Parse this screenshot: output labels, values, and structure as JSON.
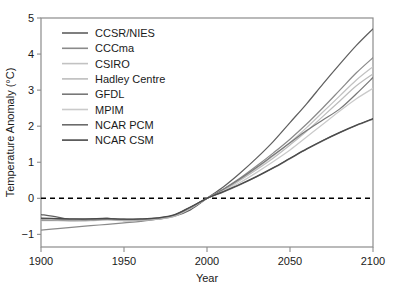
{
  "chart_data": {
    "type": "line",
    "title": "",
    "xlabel": "Year",
    "ylabel": "Temperature Anomaly (°C)",
    "xlim": [
      1900,
      2100
    ],
    "ylim": [
      -1.35,
      5.0
    ],
    "xticks": [
      1900,
      1950,
      2000,
      2050,
      2100
    ],
    "xtick_labels": [
      "1900",
      "1950",
      "2000",
      "2050",
      "2100"
    ],
    "yticks": [
      -1,
      0,
      1,
      2,
      3,
      4,
      5
    ],
    "ytick_labels": [
      "−1",
      "0",
      "1",
      "2",
      "3",
      "4",
      "5"
    ],
    "grid": false,
    "legend_position": "upper-left-inside",
    "reference_line": {
      "y": 0,
      "style": "dashed",
      "color": "#000000"
    },
    "x": [
      1900,
      1910,
      1920,
      1930,
      1940,
      1950,
      1960,
      1970,
      1980,
      1990,
      2000,
      2010,
      2020,
      2030,
      2040,
      2050,
      2060,
      2070,
      2080,
      2090,
      2100
    ],
    "series": [
      {
        "name": "CCSR/NIES",
        "color": "#5f5f5f",
        "end_value": 4.7,
        "values": [
          -0.45,
          -0.52,
          -0.6,
          -0.58,
          -0.55,
          -0.62,
          -0.6,
          -0.58,
          -0.5,
          -0.32,
          0.0,
          0.32,
          0.7,
          1.12,
          1.58,
          2.1,
          2.62,
          3.18,
          3.72,
          4.24,
          4.7
        ]
      },
      {
        "name": "CCCma",
        "color": "#8a8a8a",
        "end_value": 3.9,
        "values": [
          -0.88,
          -0.84,
          -0.8,
          -0.76,
          -0.72,
          -0.68,
          -0.64,
          -0.58,
          -0.48,
          -0.28,
          0.0,
          0.26,
          0.56,
          0.9,
          1.26,
          1.64,
          2.06,
          2.52,
          3.0,
          3.48,
          3.9
        ]
      },
      {
        "name": "CSIRO",
        "color": "#c2c2c2",
        "end_value": 3.65,
        "values": [
          -0.62,
          -0.62,
          -0.63,
          -0.62,
          -0.6,
          -0.62,
          -0.61,
          -0.58,
          -0.5,
          -0.28,
          0.0,
          0.24,
          0.52,
          0.84,
          1.18,
          1.55,
          1.96,
          2.4,
          2.84,
          3.28,
          3.65
        ]
      },
      {
        "name": "Hadley Centre",
        "color": "#bdbdbd",
        "end_value": 3.45,
        "values": [
          -0.6,
          -0.61,
          -0.62,
          -0.61,
          -0.59,
          -0.61,
          -0.6,
          -0.57,
          -0.49,
          -0.27,
          0.0,
          0.22,
          0.5,
          0.8,
          1.12,
          1.48,
          1.86,
          2.28,
          2.7,
          3.12,
          3.45
        ]
      },
      {
        "name": "GFDL",
        "color": "#787878",
        "end_value": 3.35,
        "values": [
          -0.6,
          -0.6,
          -0.61,
          -0.6,
          -0.58,
          -0.6,
          -0.59,
          -0.56,
          -0.48,
          -0.26,
          0.0,
          0.25,
          0.54,
          0.86,
          1.2,
          1.54,
          1.88,
          2.18,
          2.48,
          2.9,
          3.35
        ]
      },
      {
        "name": "MPIM",
        "color": "#cacaca",
        "end_value": 3.05,
        "values": [
          -0.58,
          -0.59,
          -0.6,
          -0.59,
          -0.58,
          -0.6,
          -0.59,
          -0.56,
          -0.48,
          -0.26,
          0.0,
          0.2,
          0.44,
          0.72,
          1.02,
          1.34,
          1.7,
          2.06,
          2.42,
          2.76,
          3.05
        ]
      },
      {
        "name": "NCAR PCM",
        "color": "#6b6b6b",
        "end_value": 2.2,
        "values": [
          -0.56,
          -0.57,
          -0.58,
          -0.58,
          -0.57,
          -0.58,
          -0.58,
          -0.55,
          -0.47,
          -0.25,
          0.0,
          0.18,
          0.38,
          0.6,
          0.84,
          1.1,
          1.36,
          1.6,
          1.82,
          2.02,
          2.2
        ]
      },
      {
        "name": "NCAR CSM",
        "color": "#4a4a4a",
        "end_value": 2.2,
        "values": [
          -0.55,
          -0.56,
          -0.57,
          -0.57,
          -0.56,
          -0.58,
          -0.57,
          -0.54,
          -0.46,
          -0.24,
          0.0,
          0.19,
          0.39,
          0.61,
          0.85,
          1.11,
          1.37,
          1.61,
          1.83,
          2.03,
          2.21
        ]
      }
    ]
  }
}
